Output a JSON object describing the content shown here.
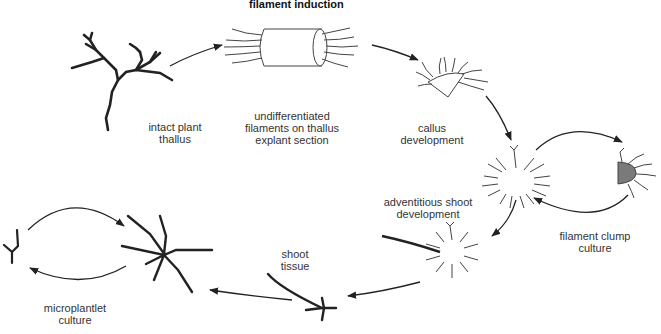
{
  "title": "filament induction",
  "labels": {
    "intact_plant": "intact plant\nthallus",
    "explant": "undifferentiated\nfilaments on thallus\nexplant section",
    "callus": "callus\ndevelopment",
    "adventitious": "adventitious shoot\ndevelopment",
    "clump": "filament clump\nculture",
    "shoot_tissue": "shoot\ntissue",
    "microplantlet": "microplantlet\nculture"
  },
  "colors": {
    "stroke": "#222222",
    "thin_stroke": "#444444",
    "clump_fill": "#7a7a7a",
    "text": "#333333"
  }
}
